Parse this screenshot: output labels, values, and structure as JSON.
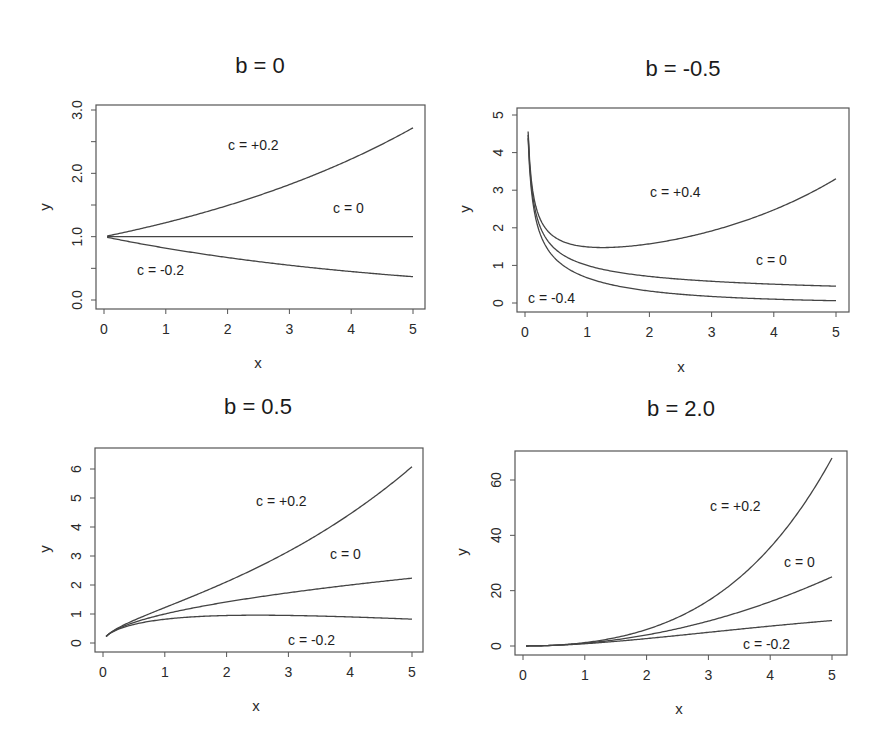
{
  "figure": {
    "formula_shape": "y = x^b * exp(c*x)",
    "panels": [
      {
        "title": "b = 0",
        "b": 0,
        "xlabel": "x",
        "ylabel": "y",
        "xlim": [
          0,
          5
        ],
        "ylim": [
          0,
          3
        ],
        "xticks": [
          "0",
          "1",
          "2",
          "3",
          "4",
          "5"
        ],
        "xtick_values": [
          0,
          1,
          2,
          3,
          4,
          5
        ],
        "yticks": [
          "0.0",
          "1.0",
          "2.0",
          "3.0"
        ],
        "ytick_values": [
          0,
          1,
          2,
          3
        ],
        "minor_yticks": [
          0.5,
          1.5,
          2.5
        ],
        "box": {
          "left": 96,
          "top": 105,
          "right": 425,
          "bottom": 309
        },
        "map": {
          "x0": 104,
          "x1": 413,
          "y0": 300,
          "y1": 110,
          "yv0": 0,
          "yv1": 3
        },
        "annotations": [
          {
            "text": "c = +0.2",
            "x": 228,
            "y": 150
          },
          {
            "text": "c = 0",
            "x": 333,
            "y": 213
          },
          {
            "text": "c = -0.2",
            "x": 137,
            "y": 275
          }
        ],
        "c_values": [
          0.2,
          0,
          -0.2
        ]
      },
      {
        "title": "b = -0.5",
        "b": -0.5,
        "xlabel": "x",
        "ylabel": "y",
        "xlim": [
          0,
          5
        ],
        "ylim": [
          0,
          5
        ],
        "xticks": [
          "0",
          "1",
          "2",
          "3",
          "4",
          "5"
        ],
        "xtick_values": [
          0,
          1,
          2,
          3,
          4,
          5
        ],
        "yticks": [
          "0",
          "1",
          "2",
          "3",
          "4",
          "5"
        ],
        "ytick_values": [
          0,
          1,
          2,
          3,
          4,
          5
        ],
        "minor_yticks": [],
        "box": {
          "left": 517,
          "top": 108,
          "right": 849,
          "bottom": 312
        },
        "map": {
          "x0": 525,
          "x1": 836,
          "y0": 303,
          "y1": 115,
          "yv0": 0,
          "yv1": 5
        },
        "annotations": [
          {
            "text": "c = +0.4",
            "x": 650,
            "y": 197
          },
          {
            "text": "c = 0",
            "x": 756,
            "y": 265
          },
          {
            "text": "c = -0.4",
            "x": 528,
            "y": 303
          }
        ],
        "c_values": [
          0.4,
          0,
          -0.4
        ]
      },
      {
        "title": "b = 0.5",
        "b": 0.5,
        "xlabel": "x",
        "ylabel": "y",
        "xlim": [
          0,
          5
        ],
        "ylim": [
          0,
          6.5
        ],
        "xticks": [
          "0",
          "1",
          "2",
          "3",
          "4",
          "5"
        ],
        "xtick_values": [
          0,
          1,
          2,
          3,
          4,
          5
        ],
        "yticks": [
          "0",
          "1",
          "2",
          "3",
          "4",
          "5",
          "6"
        ],
        "ytick_values": [
          0,
          1,
          2,
          3,
          4,
          5,
          6
        ],
        "minor_yticks": [],
        "box": {
          "left": 95,
          "top": 448,
          "right": 423,
          "bottom": 652
        },
        "map": {
          "x0": 103,
          "x1": 412,
          "y0": 643,
          "y1": 469,
          "yv0": 0,
          "yv1": 6
        },
        "annotations": [
          {
            "text": "c = +0.2",
            "x": 256,
            "y": 506
          },
          {
            "text": "c = 0",
            "x": 330,
            "y": 559
          },
          {
            "text": "c = -0.2",
            "x": 288,
            "y": 645
          }
        ],
        "c_values": [
          0.2,
          0,
          -0.2
        ]
      },
      {
        "title": "b = 2.0",
        "b": 2,
        "xlabel": "x",
        "ylabel": "y",
        "xlim": [
          0,
          5
        ],
        "ylim": [
          0,
          70
        ],
        "xticks": [
          "0",
          "1",
          "2",
          "3",
          "4",
          "5"
        ],
        "xtick_values": [
          0,
          1,
          2,
          3,
          4,
          5
        ],
        "yticks": [
          "0",
          "20",
          "40",
          "60"
        ],
        "ytick_values": [
          0,
          20,
          40,
          60
        ],
        "minor_yticks": [],
        "box": {
          "left": 515,
          "top": 451,
          "right": 847,
          "bottom": 655
        },
        "map": {
          "x0": 523,
          "x1": 832,
          "y0": 646,
          "y1": 480,
          "yv0": 0,
          "yv1": 60
        },
        "annotations": [
          {
            "text": "c = +0.2",
            "x": 710,
            "y": 511
          },
          {
            "text": "c = 0",
            "x": 784,
            "y": 567
          },
          {
            "text": "c = -0.2",
            "x": 743,
            "y": 649
          }
        ],
        "c_values": [
          0.2,
          0,
          -0.2
        ]
      }
    ]
  },
  "chart_data": [
    {
      "type": "line",
      "title": "b = 0",
      "xlabel": "x",
      "ylabel": "y",
      "xlim": [
        0,
        5
      ],
      "ylim": [
        0,
        3
      ],
      "grid": false,
      "legend": "inline annotations",
      "x": [
        0.05,
        0.5,
        1,
        1.5,
        2,
        2.5,
        3,
        3.5,
        4,
        4.5,
        5
      ],
      "series": [
        {
          "name": "c = +0.2",
          "values": [
            1.01,
            1.11,
            1.22,
            1.35,
            1.49,
            1.65,
            1.82,
            2.01,
            2.23,
            2.46,
            2.72
          ]
        },
        {
          "name": "c = 0",
          "values": [
            1,
            1,
            1,
            1,
            1,
            1,
            1,
            1,
            1,
            1,
            1
          ]
        },
        {
          "name": "c = -0.2",
          "values": [
            0.99,
            0.9,
            0.82,
            0.74,
            0.67,
            0.61,
            0.55,
            0.5,
            0.45,
            0.41,
            0.37
          ]
        }
      ]
    },
    {
      "type": "line",
      "title": "b = -0.5",
      "xlabel": "x",
      "ylabel": "y",
      "xlim": [
        0,
        5
      ],
      "ylim": [
        0,
        5
      ],
      "grid": false,
      "legend": "inline annotations",
      "x": [
        0.05,
        0.5,
        1,
        1.5,
        2,
        2.5,
        3,
        3.5,
        4,
        4.5,
        5
      ],
      "series": [
        {
          "name": "c = +0.4",
          "values": [
            4.56,
            1.73,
            1.49,
            1.49,
            1.57,
            1.72,
            1.92,
            2.17,
            2.48,
            2.86,
            3.3
          ]
        },
        {
          "name": "c = 0",
          "values": [
            4.47,
            1.41,
            1.0,
            0.82,
            0.71,
            0.63,
            0.58,
            0.53,
            0.5,
            0.47,
            0.45
          ]
        },
        {
          "name": "c = -0.4",
          "values": [
            4.38,
            1.16,
            0.67,
            0.45,
            0.32,
            0.23,
            0.17,
            0.13,
            0.1,
            0.08,
            0.06
          ]
        }
      ]
    },
    {
      "type": "line",
      "title": "b = 0.5",
      "xlabel": "x",
      "ylabel": "y",
      "xlim": [
        0,
        5
      ],
      "ylim": [
        0,
        6.5
      ],
      "grid": false,
      "legend": "inline annotations",
      "x": [
        0.05,
        0.5,
        1,
        1.5,
        2,
        2.5,
        3,
        3.5,
        4,
        4.5,
        5
      ],
      "series": [
        {
          "name": "c = +0.2",
          "values": [
            0.23,
            0.78,
            1.22,
            1.65,
            2.11,
            2.61,
            3.16,
            3.77,
            4.45,
            5.22,
            6.08
          ]
        },
        {
          "name": "c = 0",
          "values": [
            0.22,
            0.71,
            1.0,
            1.22,
            1.41,
            1.58,
            1.73,
            1.87,
            2.0,
            2.12,
            2.24
          ]
        },
        {
          "name": "c = -0.2",
          "values": [
            0.22,
            0.64,
            0.82,
            0.91,
            0.95,
            0.96,
            0.95,
            0.93,
            0.9,
            0.86,
            0.82
          ]
        }
      ]
    },
    {
      "type": "line",
      "title": "b = 2.0",
      "xlabel": "x",
      "ylabel": "y",
      "xlim": [
        0,
        5
      ],
      "ylim": [
        0,
        70
      ],
      "grid": false,
      "legend": "inline annotations",
      "x": [
        0.05,
        0.5,
        1,
        1.5,
        2,
        2.5,
        3,
        3.5,
        4,
        4.5,
        5
      ],
      "series": [
        {
          "name": "c = +0.2",
          "values": [
            0.003,
            0.28,
            1.22,
            3.04,
            5.97,
            10.3,
            16.4,
            24.7,
            35.6,
            49.8,
            68.0
          ]
        },
        {
          "name": "c = 0",
          "values": [
            0.003,
            0.25,
            1.0,
            2.25,
            4.0,
            6.25,
            9.0,
            12.25,
            16.0,
            20.25,
            25.0
          ]
        },
        {
          "name": "c = -0.2",
          "values": [
            0.002,
            0.23,
            0.82,
            1.67,
            2.68,
            3.79,
            4.94,
            6.08,
            7.19,
            8.23,
            9.2
          ]
        }
      ]
    }
  ]
}
